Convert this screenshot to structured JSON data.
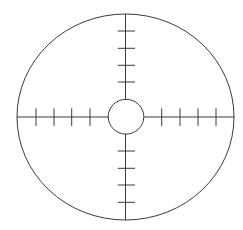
{
  "diagram": {
    "type": "reticle-crosshair",
    "stroke_color": "#3a3a3a",
    "background": "#ffffff",
    "outer_circle": {
      "cx": 125.5,
      "cy": 117,
      "rx": 108.5,
      "ry": 103
    },
    "inner_circle": {
      "cx": 126,
      "cy": 116.7,
      "rx": 18,
      "ry": 17.5
    },
    "ticks": {
      "top_y": [
        31,
        48.3,
        65.3,
        82
      ],
      "bottom_y": [
        151,
        168.3,
        185,
        202.3
      ],
      "left_x": [
        36,
        54,
        71.7,
        90
      ],
      "right_x": [
        161.7,
        180,
        198,
        216
      ],
      "count_per_arm": 4
    }
  }
}
